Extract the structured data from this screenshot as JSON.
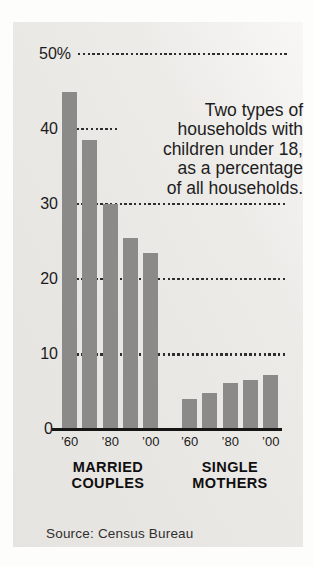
{
  "annotation": {
    "text": "Two types of\nhouseholds with\nchildren under 18,\nas a percentage\nof all households."
  },
  "source": {
    "text": "Source: Census Bureau"
  },
  "chart_data": {
    "type": "bar",
    "title": "Two types of households with children under 18, as a percentage of all households.",
    "unit": "percent of all households",
    "ylim": [
      0,
      50
    ],
    "grid": "dotted-horizontal",
    "legend_position": "none",
    "gridlines": [
      50,
      40,
      30,
      20,
      10
    ],
    "y_axis_labels": [
      "50%",
      "40",
      "30",
      "20",
      "10",
      "0"
    ],
    "categories": [
      "’60",
      "’70",
      "’80",
      "’90",
      "’00"
    ],
    "series": [
      {
        "name": "MARRIED COUPLES",
        "label_lines": [
          "MARRIED",
          "COUPLES"
        ],
        "values": [
          45,
          38.5,
          30,
          25.5,
          23.5
        ]
      },
      {
        "name": "SINGLE MOTHERS",
        "label_lines": [
          "SINGLE",
          "MOTHERS"
        ],
        "values": [
          4.1,
          4.8,
          6.2,
          6.6,
          7.2
        ]
      }
    ],
    "bar_color": "#8b8a88",
    "axis_color": "#161616"
  }
}
